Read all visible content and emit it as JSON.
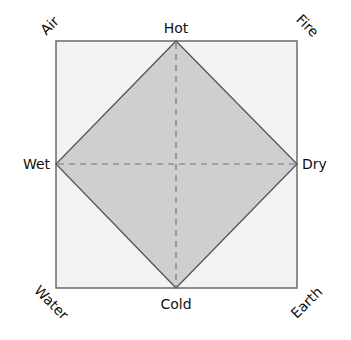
{
  "diagram": {
    "square": {
      "x": 56,
      "y": 41,
      "width": 241,
      "height": 247,
      "fill": "#f3f3f3",
      "stroke": "#6a6a6a"
    },
    "diamond": {
      "fill": "#cfcfcf",
      "stroke": "#555555"
    },
    "axes_color": "#777777",
    "qualities": {
      "top": "Hot",
      "bottom": "Cold",
      "left": "Wet",
      "right": "Dry"
    },
    "elements": {
      "top_left": "Air",
      "top_right": "Fire",
      "bottom_left": "Water",
      "bottom_right": "Earth"
    }
  }
}
